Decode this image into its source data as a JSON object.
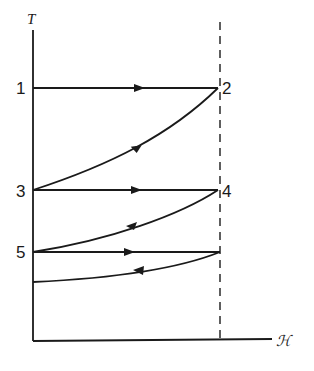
{
  "diagram": {
    "type": "thermodynamic cycle (magnetic cooling, T vs H)",
    "axes": {
      "y_label": "T",
      "x_label": "ℋ"
    },
    "points": [
      {
        "id": "1",
        "label": "1"
      },
      {
        "id": "2",
        "label": "2"
      },
      {
        "id": "3",
        "label": "3"
      },
      {
        "id": "4",
        "label": "4"
      },
      {
        "id": "5",
        "label": "5"
      }
    ],
    "paths": [
      {
        "from": "1",
        "to": "2",
        "kind": "horizontal (isothermal)",
        "direction": "right"
      },
      {
        "from": "2",
        "to": "3",
        "kind": "curve (adiabatic)",
        "direction": "down-left"
      },
      {
        "from": "3",
        "to": "4",
        "kind": "horizontal (isothermal)",
        "direction": "right"
      },
      {
        "from": "4",
        "to": "5",
        "kind": "curve (adiabatic)",
        "direction": "down-left"
      },
      {
        "from": "5",
        "to": "5'",
        "kind": "horizontal (isothermal)",
        "direction": "right"
      },
      {
        "from": "5'",
        "to": "lower",
        "kind": "curve (adiabatic)",
        "direction": "down-left"
      }
    ],
    "dashed_line": "constant field ℋ (vertical)"
  }
}
